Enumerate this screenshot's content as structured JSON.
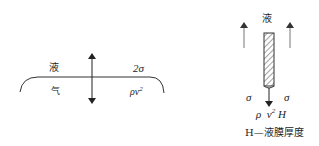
{
  "left_diagram": {
    "upper_phase": "液",
    "lower_phase": "气",
    "upper_force": "2σ",
    "lower_force_base": "ρv",
    "lower_force_exp": "2"
  },
  "right_diagram": {
    "phase_label": "液",
    "left_sigma": "σ",
    "right_sigma": "σ",
    "force_rho": "ρ",
    "force_v": "v",
    "force_exp": "2",
    "force_h": "H",
    "caption": "H—液膜厚度"
  },
  "colors": {
    "stroke": "#333333",
    "text": "#222222",
    "arrow_gray": "#777777"
  }
}
